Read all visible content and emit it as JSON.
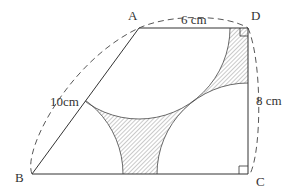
{
  "figure": {
    "vertices": {
      "A": "A",
      "B": "B",
      "C": "C",
      "D": "D"
    },
    "labels": {
      "AD": "6 cm",
      "AB": "10cm",
      "DC": "8 cm"
    },
    "colors": {
      "line": "#333333",
      "hatch": "#555555",
      "background": "#ffffff"
    }
  }
}
